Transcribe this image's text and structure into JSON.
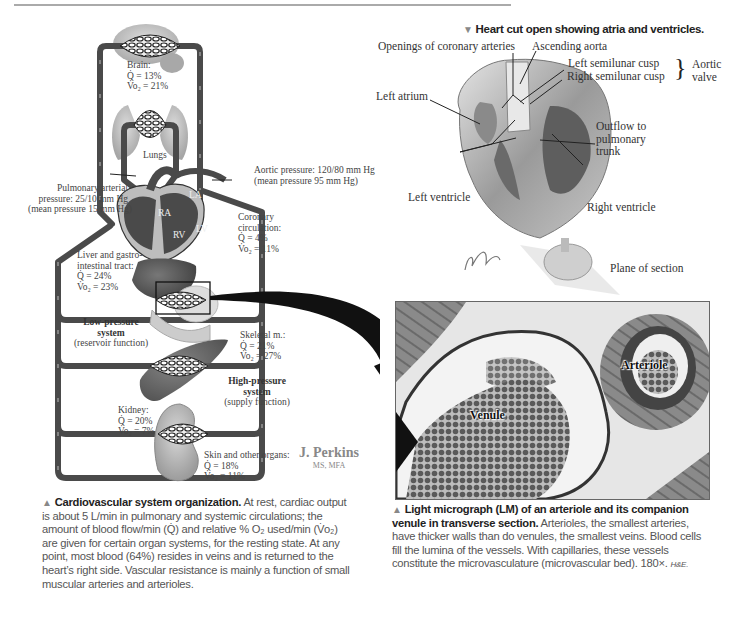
{
  "page": {
    "top_rule": true
  },
  "left_figure": {
    "diagram": {
      "brain": {
        "label": "Brain:",
        "q": "Q̇ = 13%",
        "vo2": "V̇o₂ = 21%"
      },
      "lungs": {
        "label": "Lungs"
      },
      "aortic_pressure": {
        "line1": "Aortic pressure: 120/80 mm Hg",
        "line2": "(mean pressure 95 mm Hg)"
      },
      "pulmonary_pressure": {
        "line1": "Pulmonary arterial",
        "line2": "pressure: 25/10 mm Hg",
        "line3": "(mean pressure 15 mm Hg)"
      },
      "heart_chambers": {
        "ra": "RA",
        "la": "LA",
        "rv": "RV",
        "lv": "LV"
      },
      "coronary": {
        "line1": "Coronary",
        "line2": "circulation:",
        "q": "Q̇ = 4%",
        "vo2": "V̇o₂ = 11%"
      },
      "liver": {
        "line1": "Liver and gastro-",
        "line2": "intestinal tract:",
        "q": "Q̇ = 24%",
        "vo2": "V̇o₂ = 23%"
      },
      "low_pressure": {
        "line1": "Low-pressure",
        "line2": "system",
        "line3": "(reservoir function)"
      },
      "skeletal": {
        "label": "Skeletal m.:",
        "q": "Q̇ = 21%",
        "vo2": "V̇o₂ = 27%"
      },
      "high_pressure": {
        "line1": "High-pressure",
        "line2": "system",
        "line3": "(supply function)"
      },
      "kidney": {
        "label": "Kidney:",
        "q": "Q̇ = 20%",
        "vo2": "V̇o₂ = 7%"
      },
      "skin": {
        "label": "Skin and other organs:",
        "q": "Q̇ = 18%",
        "vo2": "V̇o₂ = 11%"
      }
    },
    "signature": {
      "name": "J. Perkins",
      "credentials": "MS, MFA"
    },
    "caption": {
      "marker": "▲",
      "title": "Cardiovascular system organization.",
      "body": " At rest, cardiac output is about 5 L/min in pulmonary and systemic circulations; the amount of blood flow/min (Q̇) and relative % O₂ used/min (V̇o₂) are given for certain organ systems, for the resting state. At any point, most blood (64%) resides in veins and is returned to the heart’s right side. Vascular resistance is mainly a function of small muscular arteries and arterioles."
    }
  },
  "right_top_figure": {
    "marker": "▼",
    "title": "Heart cut open showing atria and ventricles.",
    "labels": {
      "openings": "Openings of coronary arteries",
      "ascending_aorta": "Ascending aorta",
      "left_cusp": "Left semilunar cusp",
      "right_cusp": "Right semilunar cusp",
      "aortic_valve_1": "Aortic",
      "aortic_valve_2": "valve",
      "left_atrium": "Left atrium",
      "outflow_1": "Outflow to",
      "outflow_2": "pulmonary",
      "outflow_3": "trunk",
      "left_ventricle": "Left ventricle",
      "right_ventricle": "Right ventricle",
      "plane": "Plane of section"
    },
    "signature": "F. Netter M.D."
  },
  "micrograph": {
    "labels": {
      "arteriole": "Arteriole",
      "venule": "Venule"
    },
    "caption": {
      "marker": "▲",
      "title": "Light micrograph (LM) of an arteriole and its companion venule in transverse section.",
      "body": " Arterioles, the smallest arteries, have thicker walls than do venules, the smallest veins. Blood cells fill the lumina of the vessels. With capillaries, these vessels constitute the microvasculature (microvascular bed). 180×. ",
      "stain": "H&E."
    }
  }
}
